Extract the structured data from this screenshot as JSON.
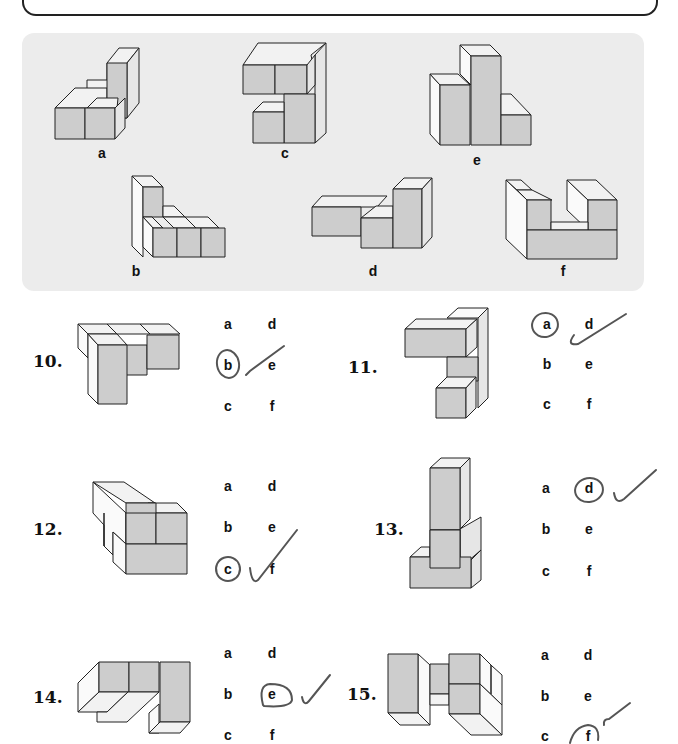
{
  "reference_figures": [
    {
      "id": "a",
      "label": "a"
    },
    {
      "id": "b",
      "label": "b"
    },
    {
      "id": "c",
      "label": "c"
    },
    {
      "id": "d",
      "label": "d"
    },
    {
      "id": "e",
      "label": "e"
    },
    {
      "id": "f",
      "label": "f"
    }
  ],
  "questions": [
    {
      "number": "10.",
      "options": [
        "a",
        "b",
        "c",
        "d",
        "e",
        "f"
      ],
      "circled": "b",
      "checked": true
    },
    {
      "number": "11.",
      "options": [
        "a",
        "b",
        "c",
        "d",
        "e",
        "f"
      ],
      "circled": "a",
      "checked": true
    },
    {
      "number": "12.",
      "options": [
        "a",
        "b",
        "c",
        "d",
        "e",
        "f"
      ],
      "circled": "c",
      "checked": true
    },
    {
      "number": "13.",
      "options": [
        "a",
        "b",
        "c",
        "d",
        "e",
        "f"
      ],
      "circled": "d",
      "checked": true
    },
    {
      "number": "14.",
      "options": [
        "a",
        "b",
        "c",
        "d",
        "e",
        "f"
      ],
      "circled": "e",
      "checked": true
    },
    {
      "number": "15.",
      "options": [
        "a",
        "b",
        "c",
        "d",
        "e",
        "f"
      ],
      "circled": "f",
      "checked": true
    }
  ],
  "colors": {
    "panel_background": "#ececec",
    "block_front": "#cdcdcd",
    "block_top": "#f2f2f2",
    "pencil_mark": "#555555"
  }
}
